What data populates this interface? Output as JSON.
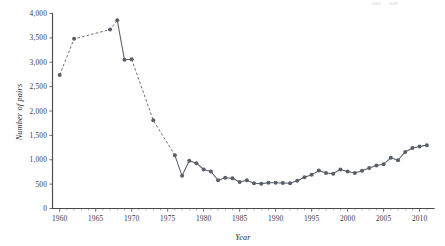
{
  "chart_data": {
    "type": "line",
    "title": "",
    "subtitle": "",
    "xlabel": "Year",
    "ylabel": "Number of pairs",
    "xlim": [
      1959,
      2012
    ],
    "ylim": [
      0,
      4000
    ],
    "grid": false,
    "legend": "none",
    "x_ticks": [
      1960,
      1965,
      1970,
      1975,
      1980,
      1985,
      1990,
      1995,
      2000,
      2005,
      2010
    ],
    "x_tick_labels": [
      "1960",
      "1965",
      "1970",
      "1975",
      "1980",
      "1985",
      "1990",
      "1995",
      "2000",
      "2005",
      "2010"
    ],
    "x_minor_tick_interval": 1,
    "y_ticks": [
      0,
      500,
      1000,
      1500,
      2000,
      2500,
      3000,
      3500,
      4000
    ],
    "y_tick_labels": [
      "0",
      "500",
      "1,000",
      "1,500",
      "2,000",
      "2,500",
      "3,000",
      "3,500",
      "4,000"
    ],
    "marker": "circle",
    "marker_color": "#595e68",
    "line_color": "#5a5f69",
    "series": [
      {
        "name": "Number of pairs",
        "linestyle_note": "dashed segments join years with missing intermediate survey data; solid segments join consecutive annual counts",
        "x": [
          1960,
          1962,
          1967,
          1968,
          1969,
          1970,
          1973,
          1976,
          1977,
          1978,
          1979,
          1980,
          1981,
          1982,
          1983,
          1984,
          1985,
          1986,
          1987,
          1988,
          1989,
          1990,
          1991,
          1992,
          1993,
          1994,
          1995,
          1996,
          1997,
          1998,
          1999,
          2000,
          2001,
          2002,
          2003,
          2004,
          2005,
          2006,
          2007,
          2008,
          2009,
          2010,
          2011
        ],
        "y": [
          2740,
          3480,
          3670,
          3860,
          3050,
          3060,
          1810,
          1090,
          670,
          980,
          930,
          800,
          760,
          580,
          630,
          620,
          545,
          580,
          520,
          510,
          530,
          530,
          525,
          520,
          570,
          640,
          690,
          780,
          730,
          715,
          800,
          760,
          730,
          775,
          830,
          880,
          910,
          1040,
          990,
          1160,
          1240,
          1270,
          1300
        ],
        "segments": [
          {
            "style": "dashed",
            "x_from": 1960,
            "x_to": 1968
          },
          {
            "style": "solid",
            "x_from": 1968,
            "x_to": 1970
          },
          {
            "style": "dashed",
            "x_from": 1970,
            "x_to": 1976
          },
          {
            "style": "solid",
            "x_from": 1976,
            "x_to": 2011
          }
        ]
      }
    ]
  },
  "axes": {
    "y_title": "Number of pairs",
    "x_title": "Year"
  }
}
